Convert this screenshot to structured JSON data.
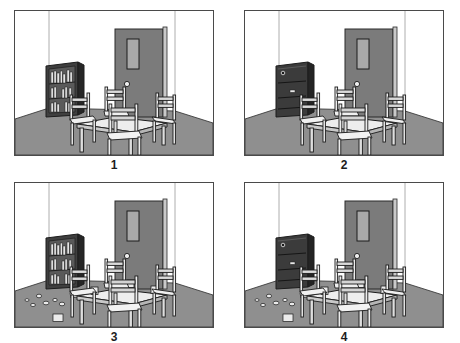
{
  "figure": {
    "layout": "2x2-grid",
    "panel_count": 4
  },
  "palette": {
    "ink": "#1c1c1c",
    "frame_border": "#4a4a4a",
    "wall": "#ffffff",
    "wall_shade": "#f2f2f2",
    "floor": "#8f8f8f",
    "floor_dark": "#7d7d7d",
    "door": "#7b7b7b",
    "door_dark": "#6a6a6a",
    "door_panel": "#a0a0a0",
    "cabinet_dark": "#3b3b3b",
    "cabinet_side": "#2a2a2a",
    "cabinet_interior": "#555555",
    "furniture_light": "#e8e8e8",
    "furniture_mid": "#cfcfcf",
    "furniture_shade": "#b5b5b5",
    "object_light": "#ededed"
  },
  "panels": [
    {
      "id": "panel-1",
      "label": "1",
      "state": "bookcase-open-tidy",
      "description": "Room with open bookcase full of books, door closed, table with four chairs, floor clear",
      "cabinet": {
        "state": "open",
        "shelves": 3,
        "has_books": true,
        "doors_visible": false
      },
      "door": {
        "state": "closed",
        "has_window_panel": true,
        "has_knob": true
      },
      "table": {
        "chairs": 4,
        "items_on_table": 0
      },
      "floor": {
        "scattered_objects": 0
      }
    },
    {
      "id": "panel-2",
      "label": "2",
      "state": "cabinet-closed-tidy",
      "description": "Same room with the cabinet doors closed, door closed, table with four chairs, floor clear",
      "cabinet": {
        "state": "closed",
        "shelves": 3,
        "has_books": false,
        "doors_visible": true
      },
      "door": {
        "state": "closed",
        "has_window_panel": true,
        "has_knob": true
      },
      "table": {
        "chairs": 4,
        "items_on_table": 0
      },
      "floor": {
        "scattered_objects": 0
      }
    },
    {
      "id": "panel-3",
      "label": "3",
      "state": "bookcase-open-messy",
      "description": "Open bookcase with books, objects scattered across the floor and cups set on the table",
      "cabinet": {
        "state": "open",
        "shelves": 3,
        "has_books": true,
        "doors_visible": false
      },
      "door": {
        "state": "closed",
        "has_window_panel": true,
        "has_knob": true
      },
      "table": {
        "chairs": 4,
        "items_on_table": 4
      },
      "floor": {
        "scattered_objects": 9
      }
    },
    {
      "id": "panel-4",
      "label": "4",
      "state": "cabinet-closed-messy",
      "description": "Closed cabinet with objects scattered across the floor and cups set on the table",
      "cabinet": {
        "state": "closed",
        "shelves": 3,
        "has_books": false,
        "doors_visible": true
      },
      "door": {
        "state": "closed",
        "has_window_panel": true,
        "has_knob": true
      },
      "table": {
        "chairs": 4,
        "items_on_table": 4
      },
      "floor": {
        "scattered_objects": 9
      }
    }
  ]
}
